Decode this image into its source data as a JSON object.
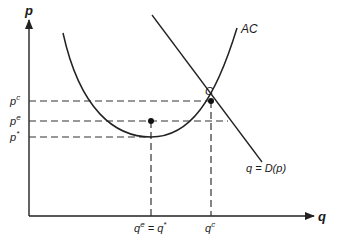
{
  "diagram": {
    "type": "economics-cost-demand",
    "axes": {
      "y_label": "p",
      "x_label": "q"
    },
    "curves": {
      "average_cost": {
        "label": "AC"
      },
      "demand": {
        "label": "q = D(p)"
      }
    },
    "points": {
      "competitive": {
        "label": "C"
      }
    },
    "price_levels": {
      "pc": {
        "base": "p",
        "sup": "c"
      },
      "pe": {
        "base": "p",
        "sup": "e"
      },
      "pstar": {
        "base": "p",
        "sup": "*"
      }
    },
    "quantity_levels": {
      "qe_eq_qstar": {
        "base1": "q",
        "sup1": "e",
        "eq": " = ",
        "base2": "q",
        "sup2": "*"
      },
      "qc": {
        "base": "q",
        "sup": "c"
      }
    },
    "colors": {
      "line": "#222222",
      "dash": "#333333"
    }
  }
}
